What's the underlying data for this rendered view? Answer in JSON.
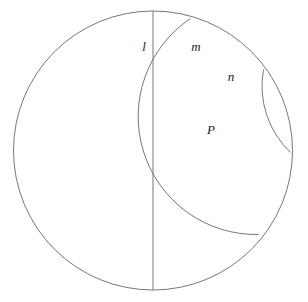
{
  "figure": {
    "name": "poincare-disk-diagram",
    "background_color": "#ffffff",
    "stroke_color": "#777777",
    "label_color": "#1a1a1a",
    "stroke_width": 1,
    "canvas": {
      "width": 308,
      "height": 302
    }
  },
  "boundary_circle": {
    "label": "boundary-circle",
    "cx": 153,
    "cy": 150.5,
    "r": 139.5
  },
  "geodesics": [
    {
      "id": "l",
      "label": "l",
      "kind": "diameter",
      "path": "M 153 11 L 153 290",
      "label_x": 144,
      "label_y": 48
    },
    {
      "id": "m",
      "label": "m",
      "kind": "arc",
      "path": "M 190.5 18.5 A 118 118 0 0 0 258.5 234.5",
      "label_x": 196,
      "label_y": 48
    },
    {
      "id": "n",
      "label": "n",
      "kind": "arc",
      "path": "M 263.5 69.5 A 92 92 0 0 0 290.5 152.5",
      "label_x": 231,
      "label_y": 78
    }
  ],
  "points": [
    {
      "id": "P",
      "label": "P",
      "x": 224,
      "y": 127,
      "label_x": 211,
      "label_y": 131
    }
  ],
  "chart_data": {
    "type": "diagram",
    "title": "",
    "subtitle": "",
    "model": "Poincare disk",
    "elements": {
      "circle": {
        "center": [
          153,
          150.5
        ],
        "radius": 139.5
      },
      "lines": [
        {
          "name": "l",
          "type": "diameter",
          "endpoints": [
            [
              153,
              11
            ],
            [
              153,
              290
            ]
          ]
        },
        {
          "name": "m",
          "type": "orthogonal-arc",
          "endpoints": [
            [
              190.5,
              18.5
            ],
            [
              258.5,
              234.5
            ]
          ],
          "arc_radius": 118
        },
        {
          "name": "n",
          "type": "orthogonal-arc",
          "endpoints": [
            [
              263.5,
              69.5
            ],
            [
              290.5,
              152.5
            ]
          ],
          "arc_radius": 92
        }
      ],
      "intersections": [
        {
          "name": "P",
          "of": [
            "m",
            "n"
          ],
          "at": [
            224,
            127
          ]
        }
      ]
    },
    "legend": [],
    "annotations": [
      "l",
      "m",
      "n",
      "P"
    ]
  }
}
